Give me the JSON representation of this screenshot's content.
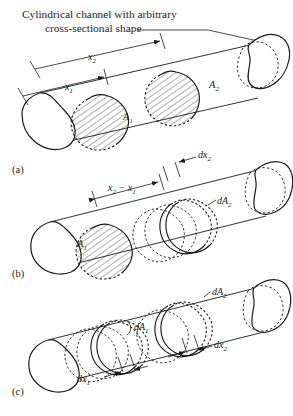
{
  "figure": {
    "title": "Cylindrical channel with arbitrary cross-sectional shape",
    "title_line1": "Cylindrical channel with arbitrary",
    "title_line2": "cross-sectional shape",
    "background_color": "#ffffff",
    "line_color": "#1a1a1a",
    "panels": [
      {
        "id": "a",
        "label": "(a)",
        "labels": [
          {
            "name": "x2",
            "text": "x₂",
            "base": "x",
            "sub": "2"
          },
          {
            "name": "x1",
            "text": "x₁",
            "base": "x",
            "sub": "1"
          },
          {
            "name": "A1",
            "text": "A₁",
            "base": "A",
            "sub": "1"
          },
          {
            "name": "A2",
            "text": "A₂",
            "base": "A",
            "sub": "2"
          }
        ]
      },
      {
        "id": "b",
        "label": "(b)",
        "labels": [
          {
            "name": "x2-minus-x1",
            "text": "x₂ − x₁"
          },
          {
            "name": "dx2",
            "text": "dx₂",
            "base": "dx",
            "sub": "2"
          },
          {
            "name": "dA2",
            "text": "dA₂",
            "base": "dA",
            "sub": "2"
          },
          {
            "name": "A1",
            "text": "A₁",
            "base": "A",
            "sub": "1"
          }
        ]
      },
      {
        "id": "c",
        "label": "(c)",
        "labels": [
          {
            "name": "dA1",
            "text": "dA₁",
            "base": "dA",
            "sub": "1"
          },
          {
            "name": "dA2",
            "text": "dA₂",
            "base": "dA",
            "sub": "2"
          },
          {
            "name": "dx1",
            "text": "dx₁",
            "base": "dx",
            "sub": "1"
          },
          {
            "name": "dx2",
            "text": "dx₂",
            "base": "dx",
            "sub": "2"
          }
        ]
      }
    ]
  }
}
